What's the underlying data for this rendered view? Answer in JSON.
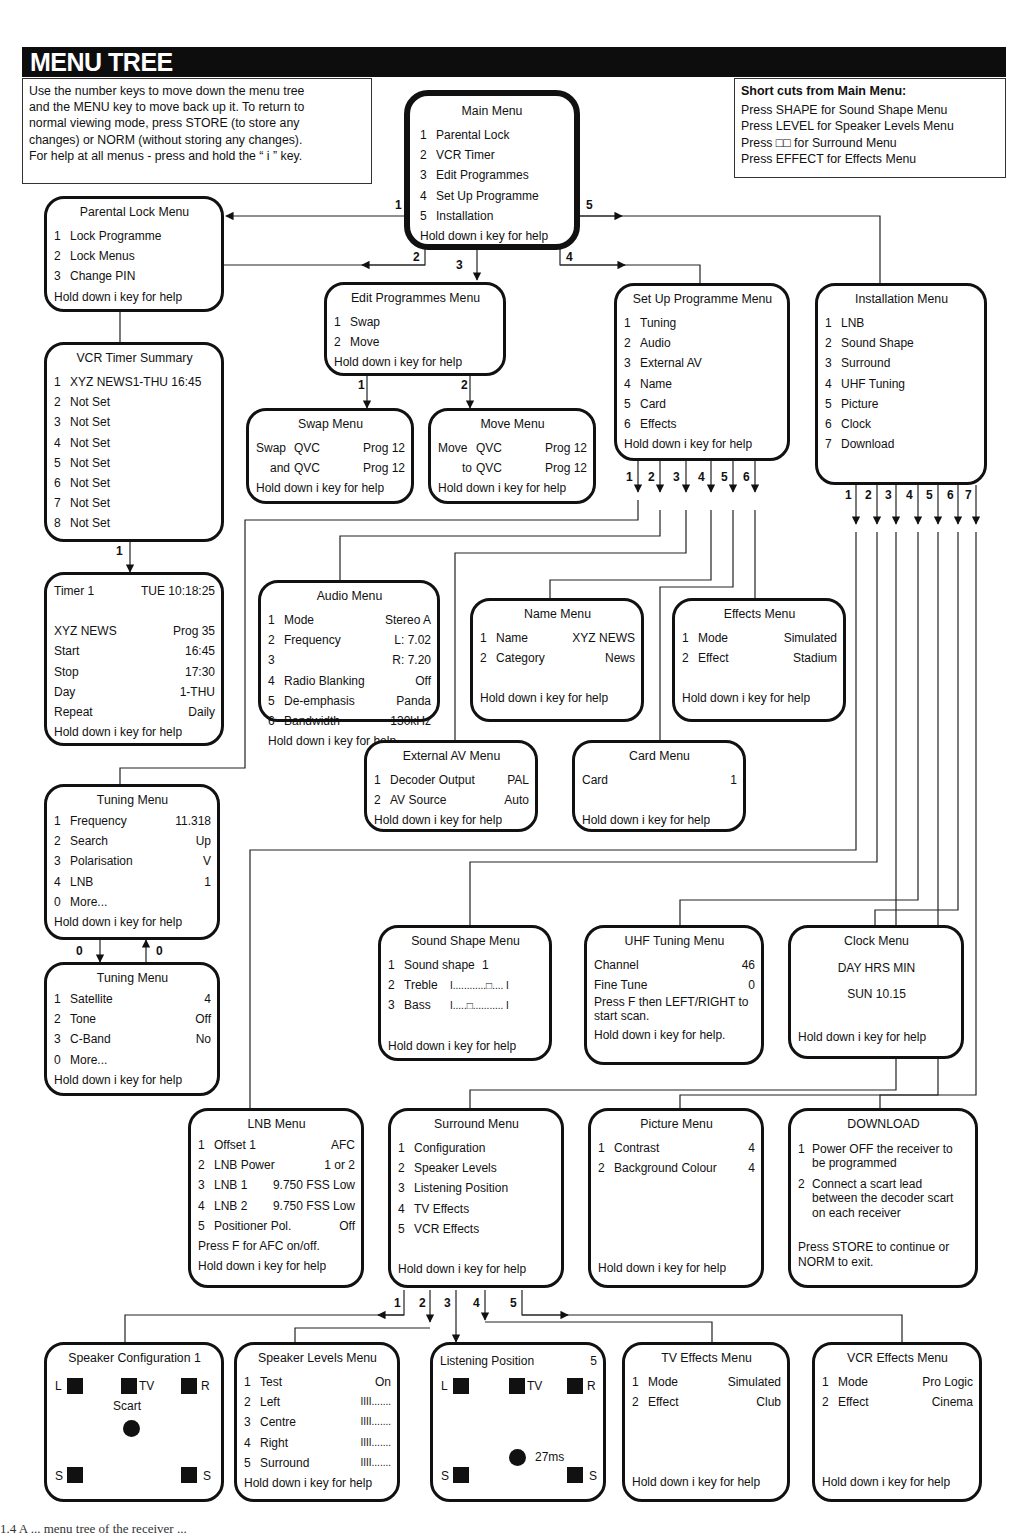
{
  "header": {
    "title": "MENU TREE"
  },
  "intro_note": {
    "lines": [
      "Use the number keys to move down the menu tree",
      "and the MENU key to move back up it. To return to",
      "normal viewing mode, press STORE (to store any",
      "changes) or NORM (without storing any changes).",
      "For help at all menus - press and hold the “ i ” key."
    ]
  },
  "shortcuts": {
    "title": "Short cuts from Main Menu:",
    "lines": [
      "Press SHAPE for Sound Shape Menu",
      "Press LEVEL for Speaker Levels Menu",
      "Press □□ for Surround Menu",
      "Press EFFECT for Effects Menu"
    ]
  },
  "help_text": "Hold down i key for help",
  "main_menu": {
    "title": "Main Menu",
    "items": [
      {
        "n": "1",
        "label": "Parental Lock"
      },
      {
        "n": "2",
        "label": "VCR Timer"
      },
      {
        "n": "3",
        "label": "Edit Programmes"
      },
      {
        "n": "4",
        "label": "Set Up Programme"
      },
      {
        "n": "5",
        "label": "Installation"
      }
    ]
  },
  "parental_lock": {
    "title": "Parental Lock Menu",
    "items": [
      {
        "n": "1",
        "label": "Lock Programme"
      },
      {
        "n": "2",
        "label": "Lock Menus"
      },
      {
        "n": "3",
        "label": "Change PIN"
      }
    ]
  },
  "vcr_timer": {
    "title": "VCR Timer Summary",
    "items": [
      {
        "n": "1",
        "label": "XYZ NEWS1-THU 16:45"
      },
      {
        "n": "2",
        "label": "Not Set"
      },
      {
        "n": "3",
        "label": "Not Set"
      },
      {
        "n": "4",
        "label": "Not Set"
      },
      {
        "n": "5",
        "label": "Not Set"
      },
      {
        "n": "6",
        "label": "Not Set"
      },
      {
        "n": "7",
        "label": "Not Set"
      },
      {
        "n": "8",
        "label": "Not Set"
      }
    ]
  },
  "timer1": {
    "title_left": "Timer 1",
    "title_right": "TUE 10:18:25",
    "rows": [
      {
        "k": "XYZ NEWS",
        "v": "Prog 35"
      },
      {
        "k": "Start",
        "v": "16:45"
      },
      {
        "k": "Stop",
        "v": "17:30"
      },
      {
        "k": "Day",
        "v": "1-THU"
      },
      {
        "k": "Repeat",
        "v": "Daily"
      }
    ]
  },
  "edit_programmes": {
    "title": "Edit Programmes Menu",
    "items": [
      {
        "n": "1",
        "label": "Swap"
      },
      {
        "n": "2",
        "label": "Move"
      }
    ]
  },
  "swap": {
    "title": "Swap Menu",
    "rows": [
      {
        "a": "Swap",
        "b": "QVC",
        "c": "Prog 12"
      },
      {
        "a": "and",
        "b": "QVC",
        "c": "Prog 12"
      }
    ]
  },
  "move": {
    "title": "Move Menu",
    "rows": [
      {
        "a": "Move",
        "b": "QVC",
        "c": "Prog 12"
      },
      {
        "a": "to",
        "b": "QVC",
        "c": "Prog 12"
      }
    ]
  },
  "setup_programme": {
    "title": "Set Up Programme Menu",
    "items": [
      {
        "n": "1",
        "label": "Tuning"
      },
      {
        "n": "2",
        "label": "Audio"
      },
      {
        "n": "3",
        "label": "External AV"
      },
      {
        "n": "4",
        "label": "Name"
      },
      {
        "n": "5",
        "label": "Card"
      },
      {
        "n": "6",
        "label": "Effects"
      }
    ]
  },
  "installation": {
    "title": "Installation Menu",
    "items": [
      {
        "n": "1",
        "label": "LNB"
      },
      {
        "n": "2",
        "label": "Sound Shape"
      },
      {
        "n": "3",
        "label": "Surround"
      },
      {
        "n": "4",
        "label": "UHF Tuning"
      },
      {
        "n": "5",
        "label": "Picture"
      },
      {
        "n": "6",
        "label": "Clock"
      },
      {
        "n": "7",
        "label": "Download"
      }
    ]
  },
  "audio": {
    "title": "Audio Menu",
    "rows": [
      {
        "n": "1",
        "k": "Mode",
        "v": "Stereo A"
      },
      {
        "n": "2",
        "k": "Frequency",
        "v": "L: 7.02"
      },
      {
        "n": "3",
        "k": "",
        "v": "R: 7.20"
      },
      {
        "n": "4",
        "k": "Radio Blanking",
        "v": "Off"
      },
      {
        "n": "5",
        "k": "De-emphasis",
        "v": "Panda"
      },
      {
        "n": "6",
        "k": "Bandwidth",
        "v": "130kHz"
      }
    ]
  },
  "name_menu": {
    "title": "Name Menu",
    "rows": [
      {
        "n": "1",
        "k": "Name",
        "v": "XYZ NEWS"
      },
      {
        "n": "2",
        "k": "Category",
        "v": "News"
      }
    ]
  },
  "effects": {
    "title": "Effects Menu",
    "rows": [
      {
        "n": "1",
        "k": "Mode",
        "v": "Simulated"
      },
      {
        "n": "2",
        "k": "Effect",
        "v": "Stadium"
      }
    ]
  },
  "external_av": {
    "title": "External AV Menu",
    "rows": [
      {
        "n": "1",
        "k": "Decoder Output",
        "v": "PAL"
      },
      {
        "n": "2",
        "k": "AV Source",
        "v": "Auto"
      }
    ]
  },
  "card": {
    "title": "Card Menu",
    "rows": [
      {
        "k": "Card",
        "v": "1"
      }
    ]
  },
  "tuning1": {
    "title": "Tuning Menu",
    "rows": [
      {
        "n": "1",
        "k": "Frequency",
        "v": "11.318"
      },
      {
        "n": "2",
        "k": "Search",
        "v": "Up"
      },
      {
        "n": "3",
        "k": "Polarisation",
        "v": "V"
      },
      {
        "n": "4",
        "k": "LNB",
        "v": "1"
      },
      {
        "n": "0",
        "k": "More...",
        "v": ""
      }
    ]
  },
  "tuning2": {
    "title": "Tuning Menu",
    "rows": [
      {
        "n": "1",
        "k": "Satellite",
        "v": "4"
      },
      {
        "n": "2",
        "k": "Tone",
        "v": "Off"
      },
      {
        "n": "3",
        "k": "C-Band",
        "v": "No"
      },
      {
        "n": "0",
        "k": "More...",
        "v": ""
      }
    ]
  },
  "sound_shape": {
    "title": "Sound Shape Menu",
    "rows": [
      {
        "n": "1",
        "k": "Sound shape",
        "v": "1"
      },
      {
        "n": "2",
        "k": "Treble",
        "v": "I............□.... I"
      },
      {
        "n": "3",
        "k": "Bass",
        "v": "I.....□........... I"
      }
    ]
  },
  "uhf_tuning": {
    "title": "UHF Tuning Menu",
    "rows": [
      {
        "k": "Channel",
        "v": "46"
      },
      {
        "k": "Fine Tune",
        "v": "0"
      }
    ],
    "note_line1": "Press F then LEFT/RIGHT to",
    "note_line2": "start scan.",
    "help": "Hold down i key for help."
  },
  "clock": {
    "title": "Clock Menu",
    "line1": "DAY HRS MIN",
    "line2": "SUN 10.15"
  },
  "lnb": {
    "title": "LNB Menu",
    "rows": [
      {
        "n": "1",
        "k": "Offset 1",
        "v": "AFC"
      },
      {
        "n": "2",
        "k": "LNB Power",
        "v": "1 or 2"
      },
      {
        "n": "3",
        "k": "LNB 1",
        "v": "9.750 FSS Low"
      },
      {
        "n": "4",
        "k": "LNB 2",
        "v": "9.750 FSS Low"
      },
      {
        "n": "5",
        "k": "Positioner Pol.",
        "v": "Off"
      }
    ],
    "note": "Press F for AFC on/off."
  },
  "surround": {
    "title": "Surround Menu",
    "items": [
      {
        "n": "1",
        "label": "Configuration"
      },
      {
        "n": "2",
        "label": "Speaker Levels"
      },
      {
        "n": "3",
        "label": "Listening Position"
      },
      {
        "n": "4",
        "label": "TV Effects"
      },
      {
        "n": "5",
        "label": "VCR Effects"
      }
    ]
  },
  "picture": {
    "title": "Picture Menu",
    "rows": [
      {
        "n": "1",
        "k": "Contrast",
        "v": "4"
      },
      {
        "n": "2",
        "k": "Background Colour",
        "v": "4"
      }
    ]
  },
  "download": {
    "title": "DOWNLOAD",
    "step1_a": "Power OFF the receiver to",
    "step1_b": "be programmed",
    "step2_a": "Connect a scart lead",
    "step2_b": "between  the decoder scart",
    "step2_c": "on each  receiver",
    "footer_a": "Press STORE to continue or",
    "footer_b": "NORM to exit."
  },
  "speaker_config": {
    "title": "Speaker Configuration 1",
    "L": "L",
    "TV": "TV",
    "R": "R",
    "S": "S",
    "scart": "Scart"
  },
  "speaker_levels": {
    "title": "Speaker Levels Menu",
    "rows": [
      {
        "n": "1",
        "k": "Test",
        "v": "On"
      },
      {
        "n": "2",
        "k": "Left",
        "v": "IIII......."
      },
      {
        "n": "3",
        "k": "Centre",
        "v": "IIII......."
      },
      {
        "n": "4",
        "k": "Right",
        "v": "IIII......."
      },
      {
        "n": "5",
        "k": "Surround",
        "v": "IIII......."
      }
    ]
  },
  "listening_position": {
    "title": "Listening Position",
    "value": "5",
    "delay": "27ms"
  },
  "tv_effects": {
    "title": "TV Effects Menu",
    "rows": [
      {
        "n": "1",
        "k": "Mode",
        "v": "Simulated"
      },
      {
        "n": "2",
        "k": "Effect",
        "v": "Club"
      }
    ]
  },
  "vcr_effects": {
    "title": "VCR Effects Menu",
    "rows": [
      {
        "n": "1",
        "k": "Mode",
        "v": "Pro Logic"
      },
      {
        "n": "2",
        "k": "Effect",
        "v": "Cinema"
      }
    ]
  },
  "connector_labels": {
    "main": [
      "1",
      "2",
      "3",
      "4",
      "5"
    ],
    "edit": [
      "1",
      "2"
    ],
    "setup": [
      "1",
      "2",
      "3",
      "4",
      "5",
      "6"
    ],
    "install": [
      "1",
      "2",
      "3",
      "4",
      "5",
      "6",
      "7"
    ],
    "vcr": "1",
    "tuning_down": "0",
    "tuning_up": "0",
    "surround": [
      "1",
      "2",
      "3",
      "4",
      "5"
    ]
  },
  "caption": "1.4    A ... menu tree of the receiver ..."
}
